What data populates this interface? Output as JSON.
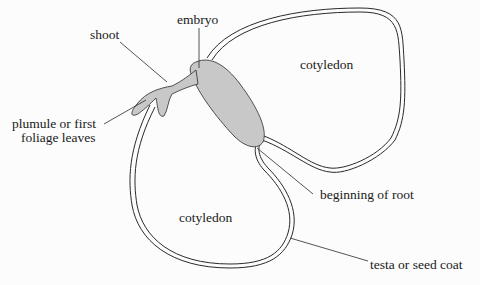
{
  "diagram": {
    "type": "labelled biology diagram",
    "labels": {
      "embryo": "embryo",
      "shoot": "shoot",
      "plumule_line1": "plumule or first",
      "plumule_line2": "foliage leaves",
      "cotyledon_upper": "cotyledon",
      "cotyledon_lower": "cotyledon",
      "root": "beginning of root",
      "testa": "testa or seed coat"
    },
    "colors": {
      "embryo_fill": "#c8c8c8",
      "outline": "#2a2a2a",
      "background": "#fcfcfc"
    }
  }
}
